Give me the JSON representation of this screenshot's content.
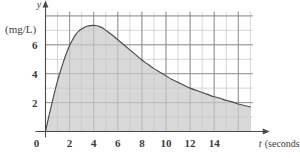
{
  "chart_data": {
    "type": "area",
    "title": "",
    "subtitle": "",
    "xlabel": "t (seconds)",
    "ylabel": "y",
    "y_unit_label": "(mg/L)",
    "x_axis_name": "t",
    "x_axis_unit": "(seconds)",
    "y_axis_name": "y",
    "xlim": [
      0,
      17.2
    ],
    "ylim": [
      0,
      8.3
    ],
    "xticks": [
      2,
      4,
      6,
      8,
      10,
      12,
      14
    ],
    "xtick_labels": [
      "2",
      "4",
      "6",
      "8",
      "10",
      "12",
      "14"
    ],
    "yticks": [
      2,
      4,
      6
    ],
    "ytick_labels": [
      "2",
      "4",
      "6"
    ],
    "origin_label": "0",
    "grid": true,
    "grid_major_step_x": 2,
    "grid_minor_step_x": 1,
    "grid_major_step_y": 2,
    "grid_minor_step_y": 1,
    "legend": "none",
    "fill": true,
    "fill_color": "#c9c9c9",
    "line_color": "#4a4a4a",
    "grid_major_color": "#8c8c8c",
    "grid_minor_color": "#c4c4c4",
    "axis_color": "#4a4a4a",
    "background_color": "#ffffff",
    "x": [
      0,
      0.25,
      0.5,
      0.75,
      1,
      1.25,
      1.5,
      1.75,
      2,
      2.25,
      2.5,
      2.75,
      3,
      3.25,
      3.5,
      3.75,
      4,
      4.25,
      4.5,
      4.75,
      5,
      5.5,
      6,
      6.5,
      7,
      7.5,
      8,
      8.5,
      9,
      9.5,
      10,
      10.5,
      11,
      11.5,
      12,
      12.5,
      13,
      13.5,
      14,
      14.5,
      15,
      15.5,
      16,
      16.5,
      17
    ],
    "values": [
      0,
      0.95,
      1.85,
      2.7,
      3.5,
      4.2,
      4.85,
      5.45,
      5.95,
      6.35,
      6.7,
      6.95,
      7.1,
      7.22,
      7.3,
      7.33,
      7.34,
      7.32,
      7.26,
      7.16,
      7.0,
      6.7,
      6.35,
      6.0,
      5.65,
      5.3,
      4.95,
      4.65,
      4.35,
      4.1,
      3.85,
      3.6,
      3.4,
      3.2,
      3.0,
      2.85,
      2.7,
      2.55,
      2.4,
      2.3,
      2.15,
      2.05,
      1.9,
      1.8,
      1.7
    ],
    "peak": {
      "x": 4,
      "y": 7.34
    },
    "start_point": {
      "x": 0,
      "y": 0
    },
    "end_point": {
      "x": 17,
      "y": 1.7
    }
  }
}
